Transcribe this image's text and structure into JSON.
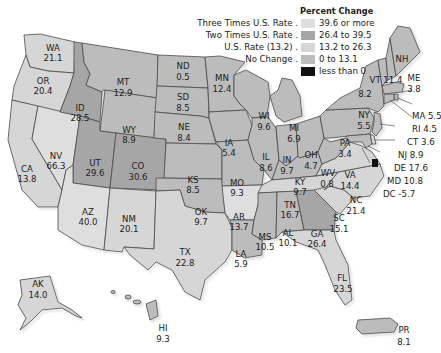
{
  "legend": {
    "title": "Percent Change",
    "rows": [
      {
        "label": "Three Times U.S. Rate .",
        "range": "39.6 or more",
        "color": "#dedede"
      },
      {
        "label": "Two Times U.S. Rate .",
        "range": "26.4 to 39.5",
        "color": "#a6a6a6"
      },
      {
        "label": "U.S. Rate (13.2) .",
        "range": "13.2 to 26.3",
        "color": "#d6d6d6"
      },
      {
        "label": "No Change .",
        "range": "0 to 13.1",
        "color": "#bcbcbc"
      },
      {
        "label": "",
        "range": "less than 0",
        "color": "#111111"
      }
    ]
  },
  "states": {
    "WA": {
      "abbr": "WA",
      "value": "21.1"
    },
    "OR": {
      "abbr": "OR",
      "value": "20.4"
    },
    "CA": {
      "abbr": "CA",
      "value": "13.8"
    },
    "NV": {
      "abbr": "NV",
      "value": "66.3"
    },
    "ID": {
      "abbr": "ID",
      "value": "28.5"
    },
    "MT": {
      "abbr": "MT",
      "value": "12.9"
    },
    "WY": {
      "abbr": "WY",
      "value": "8.9"
    },
    "UT": {
      "abbr": "UT",
      "value": "29.6"
    },
    "CO": {
      "abbr": "CO",
      "value": "30.6"
    },
    "AZ": {
      "abbr": "AZ",
      "value": "40.0"
    },
    "NM": {
      "abbr": "NM",
      "value": "20.1"
    },
    "ND": {
      "abbr": "ND",
      "value": "0.5"
    },
    "SD": {
      "abbr": "SD",
      "value": "8.5"
    },
    "NE": {
      "abbr": "NE",
      "value": "8.4"
    },
    "KS": {
      "abbr": "KS",
      "value": "8.5"
    },
    "OK": {
      "abbr": "OK",
      "value": "9.7"
    },
    "TX": {
      "abbr": "TX",
      "value": "22.8"
    },
    "MN": {
      "abbr": "MN",
      "value": "12.4"
    },
    "IA": {
      "abbr": "IA",
      "value": "5.4"
    },
    "MO": {
      "abbr": "MO",
      "value": "9.3"
    },
    "AR": {
      "abbr": "AR",
      "value": "13.7"
    },
    "LA": {
      "abbr": "LA",
      "value": "5.9"
    },
    "WI": {
      "abbr": "WI",
      "value": "9.6"
    },
    "IL": {
      "abbr": "IL",
      "value": "8.6"
    },
    "MI": {
      "abbr": "MI",
      "value": "6.9"
    },
    "IN": {
      "abbr": "IN",
      "value": "9.7"
    },
    "OH": {
      "abbr": "OH",
      "value": "4.7"
    },
    "KY": {
      "abbr": "KY",
      "value": "9.7"
    },
    "TN": {
      "abbr": "TN",
      "value": "16.7"
    },
    "MS": {
      "abbr": "MS",
      "value": "10.5"
    },
    "AL": {
      "abbr": "AL",
      "value": "10.1"
    },
    "GA": {
      "abbr": "GA",
      "value": "26.4"
    },
    "FL": {
      "abbr": "FL",
      "value": "23.5"
    },
    "SC": {
      "abbr": "SC",
      "value": "15.1"
    },
    "NC": {
      "abbr": "NC",
      "value": "21.4"
    },
    "VA": {
      "abbr": "VA",
      "value": "14.4"
    },
    "WV": {
      "abbr": "WV",
      "value": "0.8"
    },
    "PA": {
      "abbr": "PA",
      "value": "3.4"
    },
    "NY": {
      "abbr": "NY",
      "value": "5.5"
    },
    "VT": {
      "abbr": "VT",
      "value": "8.2"
    },
    "NH": {
      "abbr": "NH",
      "value": "11.4"
    },
    "ME": {
      "abbr": "ME",
      "value": "3.8"
    },
    "MA": {
      "abbr": "MA",
      "value": "5.5"
    },
    "RI": {
      "abbr": "RI",
      "value": "4.5"
    },
    "CT": {
      "abbr": "CT",
      "value": "3.6"
    },
    "NJ": {
      "abbr": "NJ",
      "value": "8.9"
    },
    "DE": {
      "abbr": "DE",
      "value": "17.6"
    },
    "MD": {
      "abbr": "MD",
      "value": "10.8"
    },
    "DC": {
      "abbr": "DC",
      "value": "-5.7"
    },
    "AK": {
      "abbr": "AK",
      "value": "14.0"
    },
    "HI": {
      "abbr": "HI",
      "value": "9.3"
    },
    "PR": {
      "abbr": "PR",
      "value": "8.1"
    }
  },
  "callouts": {
    "MA": "MA 5.5",
    "RI": "RI 4.5",
    "CT": "CT 3.6",
    "NJ": "NJ 8.9",
    "DE": "DE 17.6",
    "MD": "MD 10.8",
    "DC": "DC -5.7",
    "VT": "VT 11.4"
  },
  "colors": {
    "three_times": "#dedede",
    "two_times": "#a6a6a6",
    "us_rate": "#d6d6d6",
    "no_change": "#bcbcbc",
    "negative": "#111111",
    "border": "#4a4a4a"
  }
}
